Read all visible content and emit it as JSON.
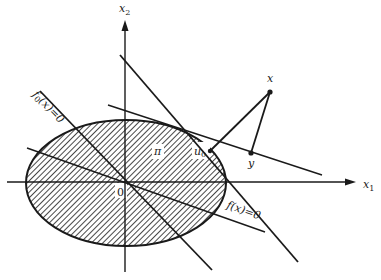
{
  "figure": {
    "axes": {
      "x_label": "x",
      "x_sub": "1",
      "y_label": "x",
      "y_sub": "2",
      "origin_label": "0"
    },
    "region": {
      "label": "π",
      "description": "hatched elliptical feasible region"
    },
    "point_u0": {
      "label": "u",
      "sub": "0"
    },
    "point_x": {
      "label": "x"
    },
    "point_y": {
      "label": "y"
    },
    "constraint_f0": {
      "label_f": "f",
      "label_sub": "0",
      "label_rest": "(x)=0"
    },
    "constraint_f": {
      "label_f": "f",
      "label_rest": "(x)=0"
    },
    "colors": {
      "ink": "#1a1a1a",
      "background": "#ffffff"
    }
  }
}
